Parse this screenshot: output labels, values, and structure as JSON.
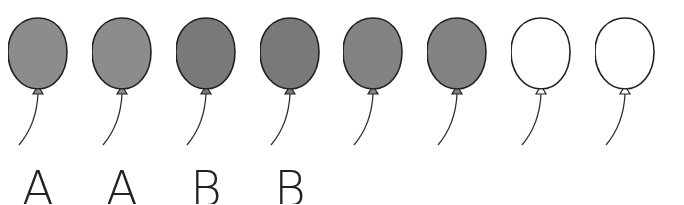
{
  "balloons": [
    {
      "fill": "#8c8c8c",
      "label": "A"
    },
    {
      "fill": "#8c8c8c",
      "label": "A"
    },
    {
      "fill": "#797979",
      "label": "B"
    },
    {
      "fill": "#797979",
      "label": "B"
    },
    {
      "fill": "#838383",
      "label": ""
    },
    {
      "fill": "#838383",
      "label": ""
    },
    {
      "fill": "#ffffff",
      "label": ""
    },
    {
      "fill": "#ffffff",
      "label": ""
    }
  ],
  "colors": {
    "outline": "#222222",
    "string": "#333333"
  }
}
